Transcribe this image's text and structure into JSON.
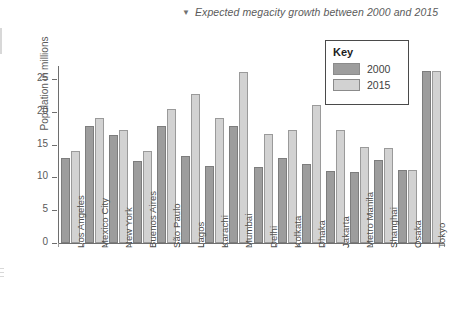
{
  "caption": {
    "marker": "triangle-down",
    "text": "Expected megacity growth between 2000 and 2015"
  },
  "legend": {
    "title": "Key",
    "entries": [
      {
        "label": "2000",
        "color": "#9d9d9d"
      },
      {
        "label": "2015",
        "color": "#d2d2d2"
      }
    ]
  },
  "chart_data": {
    "type": "bar",
    "title": "Expected megacity growth between 2000 and 2015",
    "xlabel": "",
    "ylabel": "Population in millions",
    "ylim": [
      0,
      27
    ],
    "yticks": [
      0,
      5,
      10,
      15,
      20,
      25
    ],
    "grid": false,
    "legend_position": "top-right",
    "categories": [
      "Los Angeles",
      "Mexico City",
      "New York",
      "Buenos Aires",
      "São Paulo",
      "Lagos",
      "Karachi",
      "Mumbai",
      "Delhi",
      "Kolkata",
      "Dhaka",
      "Jakarta",
      "Metro Manila",
      "Shanghai",
      "Osaka",
      "Tokyo"
    ],
    "series": [
      {
        "name": "2000",
        "color": "#9d9d9d",
        "values": [
          13.0,
          17.9,
          16.5,
          12.5,
          17.8,
          13.2,
          11.8,
          17.9,
          11.6,
          12.9,
          12.1,
          11.0,
          10.8,
          12.6,
          11.1,
          26.3
        ]
      },
      {
        "name": "2015",
        "color": "#d2d2d2",
        "values": [
          14.0,
          19.1,
          17.2,
          14.0,
          20.4,
          22.8,
          19.0,
          26.1,
          16.7,
          17.2,
          21.0,
          17.2,
          14.6,
          14.5,
          11.2,
          26.3
        ]
      }
    ]
  }
}
